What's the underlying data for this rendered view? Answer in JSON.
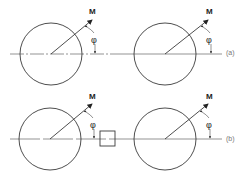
{
  "figure": {
    "panels": [
      {
        "id": "a",
        "label": "(a)",
        "figures": [
          {
            "cx": 51,
            "cy": 54,
            "r": 31,
            "tip_x": 92,
            "tip_y": 20,
            "vector_label": "M",
            "angle_label": "φ",
            "has_box": false
          },
          {
            "cx": 165,
            "cy": 54,
            "r": 31,
            "tip_x": 208,
            "tip_y": 20,
            "vector_label": "M",
            "angle_label": "φ",
            "has_box": false
          }
        ]
      },
      {
        "id": "b",
        "label": "(b)",
        "figures": [
          {
            "cx": 50,
            "cy": 139,
            "r": 31,
            "tip_x": 92,
            "tip_y": 104,
            "vector_label": "M",
            "angle_label": "φ",
            "has_box": true
          },
          {
            "cx": 165,
            "cy": 139,
            "r": 31,
            "tip_x": 208,
            "tip_y": 104,
            "vector_label": "M",
            "angle_label": "φ",
            "has_box": false
          }
        ]
      }
    ],
    "colors": {
      "line": "#3a3a3a",
      "label": "#777777"
    }
  }
}
